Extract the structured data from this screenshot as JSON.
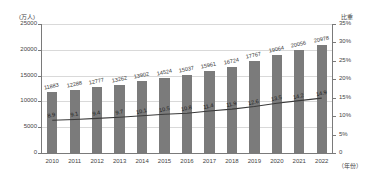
{
  "chart_data": {
    "type": "bar",
    "title": "",
    "xlabel": "（年份）",
    "ylabel": "(万人)",
    "y2label": "比重",
    "categories": [
      "2010",
      "2011",
      "2012",
      "2013",
      "2014",
      "2015",
      "2016",
      "2017",
      "2018",
      "2019",
      "2020",
      "2021",
      "2022"
    ],
    "ylim": [
      0,
      25000
    ],
    "y2lim": [
      0,
      35
    ],
    "grid": true,
    "legend": "none",
    "series": [
      {
        "name": "人数",
        "type": "bar",
        "axis": "left",
        "color": "#7b7b7b",
        "values": [
          11883,
          12288,
          12777,
          13262,
          13902,
          14524,
          15037,
          15961,
          16724,
          17767,
          19064,
          20056,
          20978
        ]
      },
      {
        "name": "比重",
        "type": "line",
        "axis": "right",
        "color": "#3a3a3a",
        "values": [
          8.9,
          9.1,
          9.4,
          9.7,
          10.1,
          10.5,
          10.8,
          11.4,
          11.9,
          12.6,
          13.5,
          14.2,
          14.9
        ]
      }
    ],
    "yticks": [
      "0",
      "5000",
      "10000",
      "15000",
      "20000",
      "25000"
    ],
    "y2ticks": [
      "0",
      "5%",
      "10%",
      "15%",
      "20%",
      "25%",
      "30%",
      "35%"
    ]
  }
}
